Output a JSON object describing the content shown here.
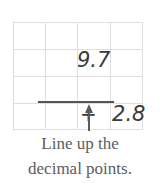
{
  "figure": {
    "grid": {
      "columns": 4,
      "rows": 4,
      "line_color": "#dedede"
    },
    "problem": {
      "addend1": "9.7",
      "operator": "+",
      "addend2": "2.8",
      "rule_color": "#545454"
    },
    "annotation": {
      "arrow": "up-arrow-icon",
      "arrow_color": "#5a5a5a",
      "caption_line1": "Line up the",
      "caption_line2": "decimal points.",
      "caption_color": "#5d5d5d"
    }
  }
}
